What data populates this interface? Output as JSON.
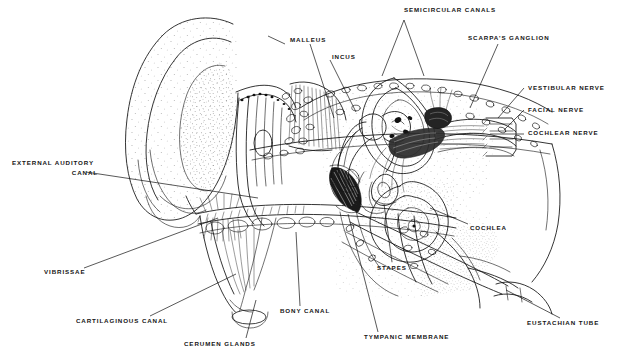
{
  "figure": {
    "type": "line-drawing",
    "style": "black-and-white stippled medical illustration",
    "width": 618,
    "height": 358,
    "background_color": "#ffffff",
    "ink_color": "#111111"
  },
  "labels": [
    {
      "id": "semicircular-canals",
      "text": "SEMICIRCULAR CANALS",
      "x": 404,
      "y": 11,
      "align": "center",
      "lines": [
        "SEMICIRCULAR CANALS"
      ]
    },
    {
      "id": "malleus",
      "text": "MALLEUS",
      "x": 290,
      "y": 40,
      "align": "left",
      "lines": [
        "MALLEUS"
      ]
    },
    {
      "id": "incus",
      "text": "INCUS",
      "x": 332,
      "y": 57,
      "align": "left",
      "lines": [
        "INCUS"
      ]
    },
    {
      "id": "scarpas-ganglion",
      "text": "SCARPA'S GANGLION",
      "x": 468,
      "y": 38,
      "align": "left",
      "lines": [
        "SCARPA'S GANGLION"
      ]
    },
    {
      "id": "vestibular-nerve",
      "text": "VESTIBULAR NERVE",
      "x": 528,
      "y": 88,
      "align": "left",
      "lines": [
        "VESTIBULAR NERVE"
      ]
    },
    {
      "id": "facial-nerve",
      "text": "FACIAL NERVE",
      "x": 528,
      "y": 110,
      "align": "left",
      "lines": [
        "FACIAL NERVE"
      ]
    },
    {
      "id": "cochlear-nerve",
      "text": "COCHLEAR NERVE",
      "x": 528,
      "y": 133,
      "align": "left",
      "lines": [
        "COCHLEAR NERVE"
      ]
    },
    {
      "id": "external-auditory-canal",
      "text": "EXTERNAL AUDITORY CANAL",
      "x": 12,
      "y": 162,
      "align": "left",
      "lines": [
        "EXTERNAL AUDITORY",
        "CANAL"
      ]
    },
    {
      "id": "cochlea",
      "text": "COCHLEA",
      "x": 470,
      "y": 228,
      "align": "left",
      "lines": [
        "COCHLEA"
      ]
    },
    {
      "id": "stapes",
      "text": "STAPES",
      "x": 377,
      "y": 268,
      "align": "left",
      "lines": [
        "STAPES"
      ]
    },
    {
      "id": "vibrissae",
      "text": "VIBRISSAE",
      "x": 44,
      "y": 272,
      "align": "left",
      "lines": [
        "VIBRISSAE"
      ]
    },
    {
      "id": "cartilaginous-canal",
      "text": "CARTILAGINOUS CANAL",
      "x": 76,
      "y": 321,
      "align": "left",
      "lines": [
        "CARTILAGINOUS CANAL"
      ]
    },
    {
      "id": "bony-canal",
      "text": "BONY CANAL",
      "x": 280,
      "y": 311,
      "align": "left",
      "lines": [
        "BONY CANAL"
      ]
    },
    {
      "id": "cerumen-glands",
      "text": "CERUMEN GLANDS",
      "x": 184,
      "y": 344,
      "align": "left",
      "lines": [
        "CERUMEN GLANDS"
      ]
    },
    {
      "id": "tympanic-membrane",
      "text": "TYMPANIC MEMBRANE",
      "x": 364,
      "y": 337,
      "align": "left",
      "lines": [
        "TYMPANIC MEMBRANE"
      ]
    },
    {
      "id": "eustachian-tube",
      "text": "EUSTACHIAN TUBE",
      "x": 527,
      "y": 323,
      "align": "left",
      "lines": [
        "EUSTACHIAN TUBE"
      ]
    }
  ],
  "structures": [
    {
      "id": "pinna",
      "name": "pinna-auricle"
    },
    {
      "id": "external-canal",
      "name": "external-auditory-canal"
    },
    {
      "id": "cerumen-glands",
      "name": "cerumen-glands"
    },
    {
      "id": "vibrissae",
      "name": "vibrissae-hairs"
    },
    {
      "id": "tympanic-membrane",
      "name": "tympanic-membrane"
    },
    {
      "id": "malleus",
      "name": "malleus-ossicle"
    },
    {
      "id": "incus",
      "name": "incus-ossicle"
    },
    {
      "id": "stapes",
      "name": "stapes-ossicle"
    },
    {
      "id": "semicircular-canals",
      "name": "semicircular-canals"
    },
    {
      "id": "cochlea",
      "name": "cochlea-spiral"
    },
    {
      "id": "nerve-bundle",
      "name": "vestibulocochlear-nerve-bundle"
    },
    {
      "id": "eustachian-tube",
      "name": "eustachian-tube"
    },
    {
      "id": "cancellous-bone",
      "name": "cancellous-bone-texture"
    }
  ]
}
